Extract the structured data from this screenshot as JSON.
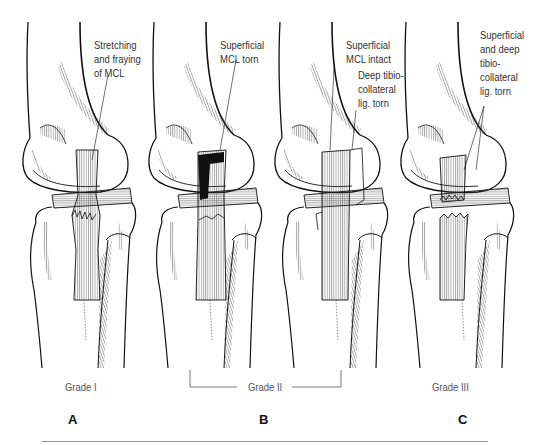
{
  "figure": {
    "panels": [
      {
        "id": "A",
        "letter": "A",
        "grade": "Grade I",
        "annotation": [
          "Stretching",
          "and fraying",
          "of MCL"
        ]
      },
      {
        "id": "B1",
        "letter": "B",
        "grade": "Grade II",
        "annotation": [
          "Superficial",
          "MCL torn"
        ]
      },
      {
        "id": "B2",
        "letter": "",
        "grade": "Grade II",
        "annotation": [
          "Superficial",
          "MCL intact"
        ],
        "annotation2": [
          "Deep tibio-",
          "collateral",
          "lig. torn"
        ]
      },
      {
        "id": "C",
        "letter": "C",
        "grade": "Grade III",
        "annotation": [
          "Superficial",
          "and deep",
          "tibio-",
          "collateral",
          "lig. torn"
        ]
      }
    ],
    "grade_labels": {
      "grade1": "Grade I",
      "grade2": "Grade II",
      "grade3": "Grade III"
    },
    "letters": {
      "a": "A",
      "b": "B",
      "c": "C"
    },
    "labels": {
      "a": {
        "l1": "Stretching",
        "l2": "and fraying",
        "l3": "of MCL"
      },
      "b1": {
        "l1": "Superficial",
        "l2": "MCL torn"
      },
      "b2": {
        "l1": "Superficial",
        "l2": "MCL intact",
        "d1": "Deep tibio-",
        "d2": "collateral",
        "d3": "lig. torn"
      },
      "c": {
        "l1": "Superficial",
        "l2": "and deep",
        "l3": "tibio-",
        "l4": "collateral",
        "l5": "lig. torn"
      }
    },
    "colors": {
      "line": "#111111",
      "hatch": "#555555",
      "text": "#333333",
      "rule": "#999999"
    }
  }
}
